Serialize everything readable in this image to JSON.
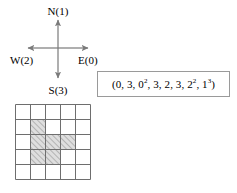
{
  "figure": {
    "background_color": "#ffffff",
    "width": 237,
    "height": 193
  },
  "compass": {
    "name": "direction-code-compass",
    "center": {
      "x": 58,
      "y": 48
    },
    "axis_color": "#7a7a7a",
    "directions": [
      {
        "id": "north",
        "label": "N(1)",
        "letter": "N",
        "code": 1,
        "angle_deg": 90
      },
      {
        "id": "east",
        "label": "E(0)",
        "letter": "E",
        "code": 0,
        "angle_deg": 0
      },
      {
        "id": "west",
        "label": "W(2)",
        "letter": "W",
        "code": 2,
        "angle_deg": 180
      },
      {
        "id": "south",
        "label": "S(3)",
        "letter": "S",
        "code": 3,
        "angle_deg": 270
      }
    ]
  },
  "sequence": {
    "name": "run-length-sequence",
    "open_paren": "(",
    "close_paren": ")",
    "separator": ", ",
    "border_color": "#9a9a9a",
    "terms": [
      {
        "base": "0",
        "exponent": ""
      },
      {
        "base": "3",
        "exponent": ""
      },
      {
        "base": "0",
        "exponent": "2"
      },
      {
        "base": "3",
        "exponent": ""
      },
      {
        "base": "2",
        "exponent": ""
      },
      {
        "base": "3",
        "exponent": ""
      },
      {
        "base": "2",
        "exponent": "2"
      },
      {
        "base": "1",
        "exponent": "3"
      }
    ],
    "plain_text": "(0, 3, 0^2, 3, 2, 3, 2^2, 1^3)"
  },
  "grid": {
    "name": "polyomino-grid",
    "rows": 5,
    "cols": 5,
    "cell_size": 15,
    "line_color": "#6e6e6e",
    "fill_color": "#d9d9d9",
    "hatch_color": "#8f8f8f",
    "shaded_cells": [
      {
        "row": 2,
        "col": 2
      },
      {
        "row": 3,
        "col": 2
      },
      {
        "row": 3,
        "col": 3
      },
      {
        "row": 3,
        "col": 4
      },
      {
        "row": 4,
        "col": 2
      },
      {
        "row": 4,
        "col": 3
      }
    ],
    "shaded_cell_count": 6
  },
  "chart_data": {
    "type": "heatmap",
    "title": "",
    "xlabel": "",
    "ylabel": "",
    "categories": [
      "c1",
      "c2",
      "c3",
      "c4",
      "c5"
    ],
    "row_labels": [
      "r1",
      "r2",
      "r3",
      "r4",
      "r5"
    ],
    "values": [
      [
        0,
        0,
        0,
        0,
        0
      ],
      [
        0,
        1,
        0,
        0,
        0
      ],
      [
        0,
        1,
        1,
        1,
        0
      ],
      [
        0,
        1,
        1,
        0,
        0
      ],
      [
        0,
        0,
        0,
        0,
        0
      ]
    ],
    "legend": [
      "0 = empty",
      "1 = hatched"
    ],
    "grid": true
  }
}
